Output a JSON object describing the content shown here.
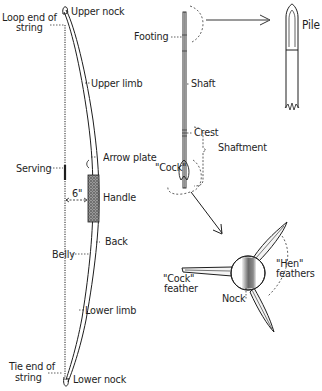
{
  "diagram": {
    "bow": {
      "labels": {
        "upper_nock": "Upper nock",
        "loop_end_1": "Loop end of",
        "loop_end_2": "string",
        "upper_limb": "Upper limb",
        "arrow_plate": "Arrow plate",
        "serving": "Serving",
        "brace_height": "6\"",
        "handle": "Handle",
        "back": "Back",
        "belly": "Belly",
        "lower_limb": "Lower limb",
        "tie_end_1": "Tie end of",
        "tie_end_2": "string",
        "lower_nock": "Lower nock"
      }
    },
    "arrow": {
      "labels": {
        "footing": "Footing",
        "pile": "Pile",
        "shaft": "Shaft",
        "crest": "Crest",
        "shaftment": "Shaftment",
        "cock": "\"Cock\""
      }
    },
    "nock_detail": {
      "labels": {
        "hen_1": "\"Hen\"",
        "hen_2": "feathers",
        "cock_1": "\"Cock\"",
        "cock_2": "feather",
        "nock": "Nock"
      }
    },
    "colors": {
      "ink": "#1e1e1e",
      "background": "#ffffff",
      "handle_shade": "#6a6a6a"
    }
  }
}
